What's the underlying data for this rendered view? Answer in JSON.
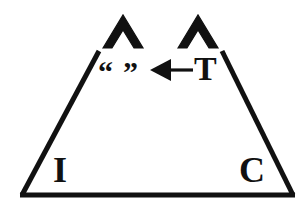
{
  "figure": {
    "background_color": "#ffffff",
    "ink_color": "#111111",
    "shape": {
      "name": "trapezoid",
      "description": "Trapezoid outline with an open (missing) top edge",
      "stroke_width_px": 5,
      "left_side": {
        "top_x": 99,
        "top_y": 51,
        "bottom_x": 22,
        "bottom_y": 195
      },
      "right_side": {
        "top_x": 222,
        "top_y": 51,
        "bottom_x": 293,
        "bottom_y": 195
      },
      "base": {
        "left_x": 22,
        "right_x": 293,
        "y": 195
      }
    },
    "carets": [
      {
        "label": "left-caret",
        "apex_x": 123,
        "apex_y": 15,
        "half_width": 21,
        "height": 33
      },
      {
        "label": "right-caret",
        "apex_x": 198,
        "apex_y": 15,
        "half_width": 21,
        "height": 33
      }
    ],
    "arrow": {
      "label": "left-pointing-arrow",
      "direction": "left",
      "tail_x": 193,
      "head_x": 152,
      "y": 70,
      "shaft_width_px": 3,
      "head_length_px": 18,
      "head_half_height_px": 11
    },
    "labels": {
      "bottom_left": "I",
      "bottom_right": "C",
      "arrow_source": "T",
      "quote_open": "“",
      "quote_close": "”"
    }
  }
}
